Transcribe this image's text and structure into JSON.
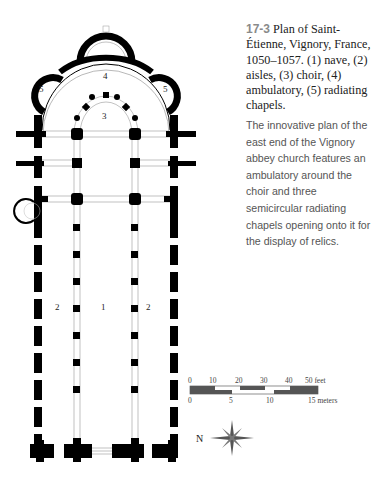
{
  "caption": {
    "figure_number": "17-3",
    "title": "Plan of Saint-Étienne, Vignory, France, 1050–1057. (1) nave, (2) aisles, (3) choir, (4) ambulatory, (5) radiating chapels."
  },
  "description": "The innovative plan of the east end of the Vignory abbey church features an ambulatory around the choir and three semicircular radiating chapels opening onto it for the display of relics.",
  "plan_labels": {
    "nave": "1",
    "aisle_left": "2",
    "aisle_right": "2",
    "choir": "3",
    "ambulatory": "4",
    "chapel_left": "5",
    "chapel_right": "5"
  },
  "scale_bar": {
    "feet_ticks": [
      "0",
      "10",
      "20",
      "30",
      "40",
      "50 feet"
    ],
    "meter_ticks": [
      "0",
      "5",
      "10",
      "15 meters"
    ]
  },
  "compass": {
    "label": "N"
  }
}
